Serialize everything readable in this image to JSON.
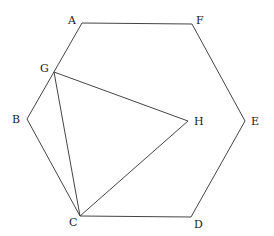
{
  "diagram": {
    "title": "",
    "points": {
      "A": {
        "label": "A",
        "x": 82,
        "y": 23,
        "lx": 68,
        "ly": 24
      },
      "F": {
        "label": "F",
        "x": 192,
        "y": 24,
        "lx": 197,
        "ly": 24
      },
      "E": {
        "label": "E",
        "x": 245,
        "y": 121,
        "lx": 252,
        "ly": 125
      },
      "D": {
        "label": "D",
        "x": 191,
        "y": 217,
        "lx": 194,
        "ly": 228
      },
      "C": {
        "label": "C",
        "x": 80,
        "y": 216,
        "lx": 69,
        "ly": 225
      },
      "B": {
        "label": "B",
        "x": 27,
        "y": 119,
        "lx": 12,
        "ly": 123
      },
      "G": {
        "label": "G",
        "x": 54,
        "y": 72,
        "lx": 40,
        "ly": 72
      },
      "H": {
        "label": "H",
        "x": 188,
        "y": 121,
        "lx": 194,
        "ly": 125
      }
    },
    "hexagon": [
      "A",
      "F",
      "E",
      "D",
      "C",
      "B"
    ],
    "segments": [
      [
        "G",
        "H"
      ],
      [
        "H",
        "C"
      ],
      [
        "C",
        "G"
      ]
    ]
  }
}
